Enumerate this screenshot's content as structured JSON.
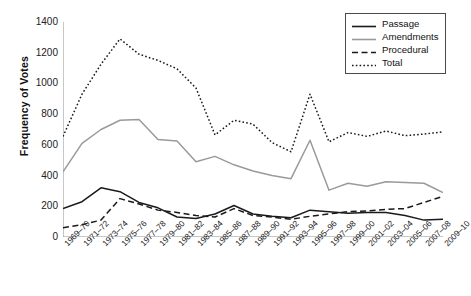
{
  "chart_data": {
    "type": "line",
    "title": "",
    "xlabel": "",
    "ylabel": "Frequency of Votes",
    "ylim": [
      0,
      1400
    ],
    "yticks": [
      0,
      200,
      400,
      600,
      800,
      1000,
      1200,
      1400
    ],
    "grid": false,
    "legend_position": "top-right",
    "categories": [
      "1969–70",
      "1971–72",
      "1973–74",
      "1975–76",
      "1977–78",
      "1979–80",
      "1981–82",
      "1983–84",
      "1985–86",
      "1987–88",
      "1989–90",
      "1991–92",
      "1993–94",
      "1995–96",
      "1997–98",
      "1999–00",
      "2001–02",
      "2003–04",
      "2005–06",
      "2007–08",
      "2009–10"
    ],
    "series": [
      {
        "name": "Passage",
        "style": "solid",
        "color": "#1a1a1a",
        "values": [
          185,
          230,
          320,
          295,
          225,
          190,
          130,
          120,
          150,
          205,
          150,
          135,
          125,
          175,
          165,
          155,
          160,
          160,
          140,
          110,
          115
        ]
      },
      {
        "name": "Amendments",
        "style": "solid",
        "color": "#9a9a9a",
        "values": [
          425,
          610,
          700,
          760,
          765,
          635,
          625,
          490,
          525,
          470,
          430,
          400,
          380,
          630,
          305,
          350,
          330,
          360,
          355,
          350,
          290
        ]
      },
      {
        "name": "Procedural",
        "style": "dashed",
        "color": "#1a1a1a",
        "values": [
          60,
          80,
          110,
          250,
          215,
          175,
          160,
          140,
          130,
          185,
          140,
          130,
          115,
          135,
          150,
          165,
          170,
          180,
          185,
          225,
          265
        ]
      },
      {
        "name": "Total",
        "style": "dotted",
        "color": "#1a1a1a",
        "values": [
          655,
          930,
          1125,
          1290,
          1190,
          1150,
          1095,
          970,
          665,
          760,
          735,
          615,
          555,
          930,
          620,
          680,
          655,
          690,
          660,
          670,
          685
        ]
      }
    ]
  },
  "legend": {
    "items": [
      {
        "label": "Passage"
      },
      {
        "label": "Amendments"
      },
      {
        "label": "Procedural"
      },
      {
        "label": "Total"
      }
    ]
  }
}
